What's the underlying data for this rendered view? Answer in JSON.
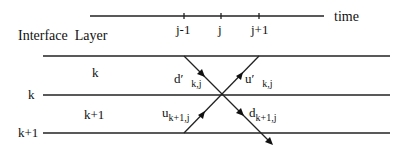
{
  "time_axis": {
    "label": "time",
    "ticks": [
      "j-1",
      "j",
      "j+1"
    ]
  },
  "header_label": "Interface  Layer",
  "interfaces": [
    "k",
    "k+1"
  ],
  "layers": [
    "k",
    "k+1"
  ],
  "waves": {
    "d_prime": {
      "main": "d′",
      "sub": "k,j"
    },
    "u_prime": {
      "main": "u′",
      "sub": "k,j"
    },
    "u": {
      "main": "u",
      "sub": "k+1,j"
    },
    "d": {
      "main": "d",
      "sub": "k+1,j"
    }
  }
}
